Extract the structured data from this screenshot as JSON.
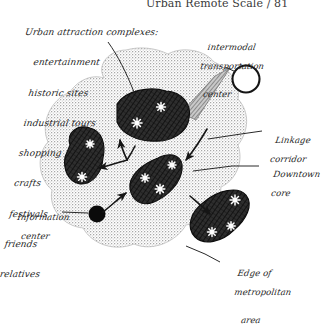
{
  "page": {
    "header": "Urban Remote Scale / 81",
    "background_color": "#ffffff",
    "ink_color": "#232323",
    "metro_fill": "#d9d9d9",
    "complex_fill": "#3a3a3a"
  },
  "legend_block": {
    "title": "Urban attraction complexes:",
    "items": [
      "entertainment",
      "historic sites",
      "industrial tours",
      "shopping",
      "crafts",
      "festivals",
      "friends",
      "relatives"
    ]
  },
  "labels": {
    "intermodal": {
      "line1": "intermodal",
      "line2": "transportation",
      "line3": "center"
    },
    "linkage": {
      "line1": "Linkage",
      "line2": "corridor"
    },
    "downtown": {
      "line1": "Downtown",
      "line2": "core"
    },
    "information": {
      "line1": "Information",
      "line2": "center"
    },
    "edge": {
      "line1": "Edge of",
      "line2": "metropolitan",
      "line3": "area"
    }
  },
  "map": {
    "metropolitan_area_name": "metropolitan-area-blob",
    "attraction_complexes": [
      {
        "id": "complex-north",
        "stars": 2
      },
      {
        "id": "complex-west",
        "stars": 2
      },
      {
        "id": "complex-center",
        "stars": 3
      },
      {
        "id": "complex-south",
        "stars": 3
      }
    ],
    "intermodal_center_marker": "open-circle",
    "information_center_marker": "filled-circle",
    "linkage_corridor_marker": "hatched-band",
    "flow_arrows": 4
  }
}
